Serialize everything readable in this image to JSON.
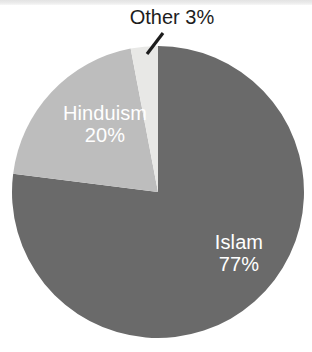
{
  "figure": {
    "background_color": "#ffffff",
    "top_band_color": "#e9e9e9",
    "other_label_text": "Other 3%"
  },
  "chart_data": {
    "type": "pie",
    "title": "",
    "subtitle": "",
    "xlabel": "",
    "ylabel": "",
    "grid": false,
    "legend_position": "none",
    "units": "percent",
    "start_angle_deg": 0,
    "direction": "clockwise",
    "categories": [
      "Islam",
      "Hinduism",
      "Other"
    ],
    "values": [
      77,
      20,
      3
    ],
    "labels": [
      "Islam 77%",
      "Hinduism 20%",
      "Other 3%"
    ],
    "colors": [
      "#6a6a6a",
      "#bdbdbd",
      "#e8e8e6"
    ],
    "slices": [
      {
        "name": "Islam",
        "value": 77,
        "value_text": "77%",
        "color": "#6a6a6a",
        "label_placement": "inside",
        "label_color": "#ffffff"
      },
      {
        "name": "Hinduism",
        "value": 20,
        "value_text": "20%",
        "color": "#bdbdbd",
        "label_placement": "inside",
        "label_color": "#ffffff"
      },
      {
        "name": "Other",
        "value": 3,
        "value_text": "3%",
        "color": "#e8e8e6",
        "label_placement": "callout",
        "label_color": "#1d1d1d",
        "leader_line_color": "#1d1d1d"
      }
    ]
  },
  "slice_labels": {
    "islam": {
      "name": "Islam",
      "pct": "77%"
    },
    "hinduism": {
      "name": "Hinduism",
      "pct": "20%"
    },
    "other": {
      "text": "Other 3%"
    }
  }
}
